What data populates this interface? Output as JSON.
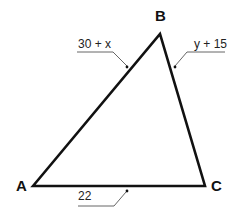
{
  "diagram": {
    "type": "triangle",
    "vertices": [
      {
        "name": "A",
        "x": 33,
        "y": 186
      },
      {
        "name": "B",
        "x": 160,
        "y": 34
      },
      {
        "name": "C",
        "x": 205,
        "y": 186
      }
    ],
    "vertex_labels": {
      "A": "A",
      "B": "B",
      "C": "C"
    },
    "edges": [
      {
        "from": "A",
        "to": "B",
        "label": "30 + x"
      },
      {
        "from": "B",
        "to": "C",
        "label": "y + 15"
      },
      {
        "from": "A",
        "to": "C",
        "label": "22"
      }
    ],
    "edge_labels": {
      "AB": "30 + x",
      "BC": "y + 15",
      "AC": "22"
    },
    "colors": {
      "stroke": "#111111",
      "leader": "#555555",
      "background": "#ffffff"
    }
  }
}
